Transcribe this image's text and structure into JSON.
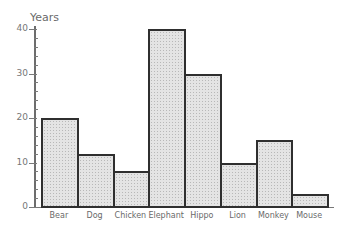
{
  "chart_data": {
    "type": "bar",
    "title": "",
    "xlabel": "",
    "ylabel": "Years",
    "categories": [
      "Bear",
      "Dog",
      "Chicken",
      "Elephant",
      "Hippo",
      "Lion",
      "Monkey",
      "Mouse"
    ],
    "values": [
      20,
      12,
      8,
      40,
      30,
      10,
      15,
      3
    ],
    "ylim": [
      0,
      40
    ],
    "yticks": [
      0,
      10,
      20,
      30,
      40
    ],
    "grid": false,
    "legend": null
  },
  "axis": {
    "ylabel": "Years",
    "ticks": [
      "0",
      "10",
      "20",
      "30",
      "40"
    ]
  },
  "colors": {
    "bar_fill": "#e4e4e4",
    "bar_border": "#2f2f2f",
    "text": "#6a6a6a"
  }
}
